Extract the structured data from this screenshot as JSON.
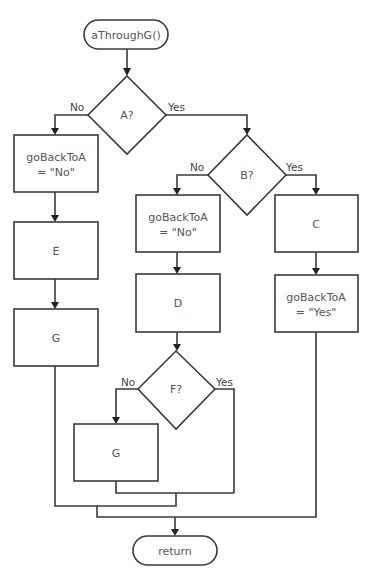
{
  "diagram": {
    "type": "flowchart",
    "nodes": {
      "start": {
        "kind": "terminal",
        "label": "aThroughG()"
      },
      "decision_a": {
        "kind": "decision",
        "label": "A?"
      },
      "left_set_no": {
        "kind": "process",
        "line1": "goBackToA",
        "line2": "= \"No\""
      },
      "left_e": {
        "kind": "process",
        "label": "E"
      },
      "left_g": {
        "kind": "process",
        "label": "G"
      },
      "decision_b": {
        "kind": "decision",
        "label": "B?"
      },
      "mid_set_no": {
        "kind": "process",
        "line1": "goBackToA",
        "line2": "= \"No\""
      },
      "mid_d": {
        "kind": "process",
        "label": "D"
      },
      "decision_f": {
        "kind": "decision",
        "label": "F?"
      },
      "mid_g": {
        "kind": "process",
        "label": "G"
      },
      "right_c": {
        "kind": "process",
        "label": "C"
      },
      "right_set_yes": {
        "kind": "process",
        "line1": "goBackToA",
        "line2": "= \"Yes\""
      },
      "end": {
        "kind": "terminal",
        "label": "return"
      }
    },
    "branch_labels": {
      "a_no": "No",
      "a_yes": "Yes",
      "b_no": "No",
      "b_yes": "Yes",
      "f_no": "No",
      "f_yes": "Yes"
    },
    "edges": [
      {
        "from": "start",
        "to": "decision_a"
      },
      {
        "from": "decision_a",
        "to": "left_set_no",
        "label": "No"
      },
      {
        "from": "decision_a",
        "to": "decision_b",
        "label": "Yes"
      },
      {
        "from": "left_set_no",
        "to": "left_e"
      },
      {
        "from": "left_e",
        "to": "left_g"
      },
      {
        "from": "decision_b",
        "to": "mid_set_no",
        "label": "No"
      },
      {
        "from": "decision_b",
        "to": "right_c",
        "label": "Yes"
      },
      {
        "from": "mid_set_no",
        "to": "mid_d"
      },
      {
        "from": "mid_d",
        "to": "decision_f"
      },
      {
        "from": "decision_f",
        "to": "mid_g",
        "label": "No"
      },
      {
        "from": "decision_f",
        "to": "end",
        "label": "Yes"
      },
      {
        "from": "mid_g",
        "to": "end"
      },
      {
        "from": "left_g",
        "to": "end"
      },
      {
        "from": "right_c",
        "to": "right_set_yes"
      },
      {
        "from": "right_set_yes",
        "to": "end"
      }
    ]
  }
}
